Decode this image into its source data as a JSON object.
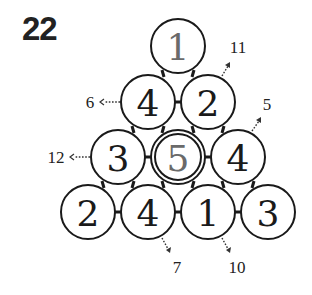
{
  "puzzle_number": "22",
  "circles": [
    {
      "id": "r1c1",
      "value": "1",
      "cx": 178,
      "cy": 46,
      "gray": true,
      "double": false
    },
    {
      "id": "r2c1",
      "value": "4",
      "cx": 148,
      "cy": 102,
      "gray": false,
      "double": false
    },
    {
      "id": "r2c2",
      "value": "2",
      "cx": 208,
      "cy": 102,
      "gray": false,
      "double": false
    },
    {
      "id": "r3c1",
      "value": "3",
      "cx": 118,
      "cy": 157,
      "gray": false,
      "double": false
    },
    {
      "id": "r3c2",
      "value": "5",
      "cx": 178,
      "cy": 157,
      "gray": true,
      "double": true
    },
    {
      "id": "r3c3",
      "value": "4",
      "cx": 238,
      "cy": 157,
      "gray": false,
      "double": false
    },
    {
      "id": "r4c1",
      "value": "2",
      "cx": 88,
      "cy": 212,
      "gray": false,
      "double": false
    },
    {
      "id": "r4c2",
      "value": "4",
      "cx": 148,
      "cy": 212,
      "gray": false,
      "double": false
    },
    {
      "id": "r4c3",
      "value": "1",
      "cx": 208,
      "cy": 212,
      "gray": false,
      "double": false
    },
    {
      "id": "r4c4",
      "value": "3",
      "cx": 268,
      "cy": 212,
      "gray": false,
      "double": false
    }
  ],
  "hints": [
    {
      "id": "hint-row2-left",
      "value": "6",
      "x": 90,
      "y": 102
    },
    {
      "id": "hint-row3-left",
      "value": "12",
      "x": 56,
      "y": 157
    },
    {
      "id": "hint-top-right",
      "value": "11",
      "x": 238,
      "y": 47
    },
    {
      "id": "hint-mid-right",
      "value": "5",
      "x": 267,
      "y": 104
    },
    {
      "id": "hint-bottom-left",
      "value": "7",
      "x": 177,
      "y": 267
    },
    {
      "id": "hint-bottom-right",
      "value": "10",
      "x": 237,
      "y": 267
    }
  ]
}
